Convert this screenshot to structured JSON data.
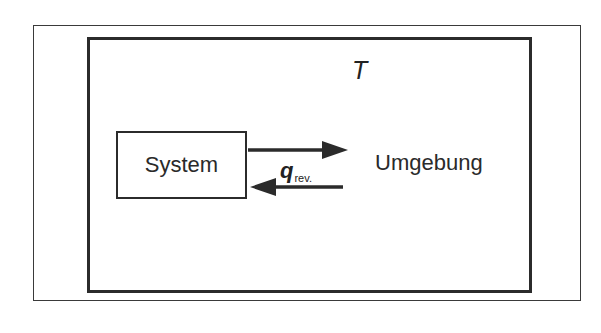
{
  "diagram": {
    "temperature_symbol": "T",
    "system_label": "System",
    "surroundings_label": "Umgebung",
    "heat": {
      "symbol": "q",
      "subscript": "rev."
    },
    "arrows": [
      {
        "name": "system-to-surroundings",
        "direction": "right"
      },
      {
        "name": "surroundings-to-system",
        "direction": "left"
      }
    ],
    "colors": {
      "stroke": "#2b2b2b",
      "background": "#ffffff"
    }
  }
}
